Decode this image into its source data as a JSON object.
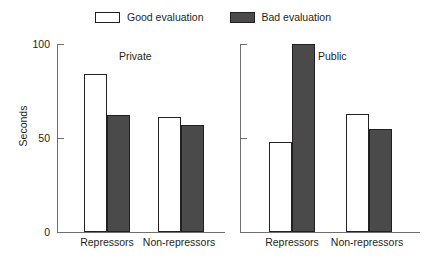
{
  "chart_data": {
    "type": "bar",
    "title": "",
    "xlabel": "",
    "ylabel": "Seconds",
    "ylim": [
      0,
      100
    ],
    "yticks": [
      "0",
      "50",
      "100"
    ],
    "grid": false,
    "legend_position": "top-center",
    "panels": [
      {
        "caption": "Private",
        "categories": [
          "Repressors",
          "Non-repressors"
        ],
        "series": [
          {
            "name": "Good evaluation",
            "values": [
              84,
              61
            ]
          },
          {
            "name": "Bad evaluation",
            "values": [
              62,
              57
            ]
          }
        ]
      },
      {
        "caption": "Public",
        "categories": [
          "Repressors",
          "Non-repressors"
        ],
        "series": [
          {
            "name": "Good evaluation",
            "values": [
              48,
              63
            ]
          },
          {
            "name": "Bad evaluation",
            "values": [
              100,
              55
            ]
          }
        ]
      }
    ],
    "colors": {
      "good": "#ffffff",
      "bad": "#4a4a4a",
      "outline": "#231f20",
      "axis": "#6e6e6e",
      "background": "#ffffff"
    }
  },
  "legend": {
    "good_label": "Good evaluation",
    "bad_label": "Bad evaluation"
  },
  "axis": {
    "y_title": "Seconds",
    "tick_100": "100",
    "tick_50": "50",
    "tick_0": "0"
  },
  "panels": {
    "private": {
      "caption": "Private",
      "group_1_label": "Repressors",
      "group_2_label": "Non-repressors"
    },
    "public": {
      "caption": "Public",
      "group_1_label": "Repressors",
      "group_2_label": "Non-repressors"
    }
  }
}
